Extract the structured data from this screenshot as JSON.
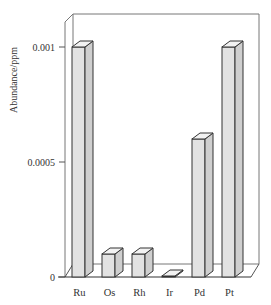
{
  "chart_data": {
    "type": "bar",
    "style": "3d",
    "title": "",
    "xlabel": "",
    "ylabel": "Abundance/ppm",
    "categories": [
      "Ru",
      "Os",
      "Rh",
      "Ir",
      "Pd",
      "Pt"
    ],
    "values": [
      0.001,
      0.0001,
      0.0001,
      3e-06,
      0.0006,
      0.001
    ],
    "yticks": [
      {
        "value": 0,
        "label": "0"
      },
      {
        "value": 0.0005,
        "label": "0.0005"
      },
      {
        "value": 0.001,
        "label": "0.001"
      }
    ],
    "ylim": [
      0,
      0.001
    ],
    "grid": false,
    "legend": null,
    "colors": {
      "bar_front": "#e2e2e2",
      "bar_side": "#cfcfcf",
      "bar_top": "#f2f2f2",
      "outline": "#333333",
      "wall": "#ffffff",
      "wall_line": "#777777"
    }
  }
}
